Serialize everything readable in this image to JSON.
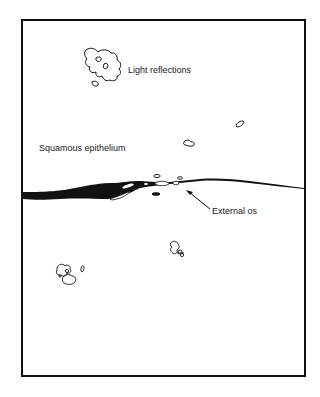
{
  "diagram": {
    "type": "colposcopy-schematic",
    "labels": {
      "light_reflections": "Light reflections",
      "squamous_epithelium": "Squamous epithelium",
      "external_os": "External os"
    },
    "colors": {
      "ink": "#111111",
      "background": "#ffffff"
    }
  }
}
